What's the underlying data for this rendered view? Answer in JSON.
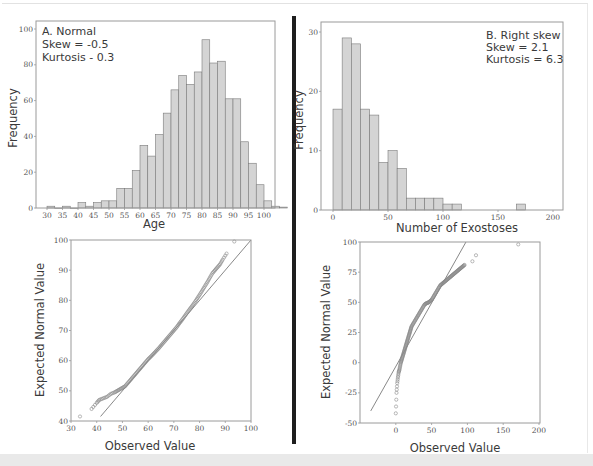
{
  "chart_data": [
    {
      "id": "hist-a",
      "type": "bar",
      "title": "A. Normal",
      "annotations": [
        "A. Normal",
        "Skew = -0.5",
        "Kurtosis - 0.3"
      ],
      "xlabel": "Age",
      "ylabel": "Frequency",
      "xlim": [
        26,
        104
      ],
      "ylim": [
        0,
        105
      ],
      "xticks": [
        30,
        35,
        40,
        45,
        50,
        55,
        60,
        65,
        70,
        75,
        80,
        85,
        90,
        95,
        100
      ],
      "yticks": [
        0,
        20,
        40,
        60,
        80,
        100
      ],
      "bin_width": 2.5,
      "bin_starts": [
        30,
        32.5,
        35,
        37.5,
        40,
        42.5,
        45,
        47.5,
        50,
        52.5,
        55,
        57.5,
        60,
        62.5,
        65,
        67.5,
        70,
        72.5,
        75,
        77.5,
        80,
        82.5,
        85,
        87.5,
        90,
        92.5,
        95,
        97.5
      ],
      "values": [
        0,
        1,
        1,
        0,
        3,
        1,
        3,
        4,
        4,
        11,
        11,
        21,
        35,
        29,
        41,
        53,
        66,
        74,
        69,
        76,
        94,
        81,
        82,
        61,
        61,
        37,
        25,
        13,
        4,
        1,
        0.5
      ],
      "bars": [
        {
          "x": 32.5,
          "v": 1
        },
        {
          "x": 35,
          "v": 0
        },
        {
          "x": 37.5,
          "v": 1
        },
        {
          "x": 40,
          "v": 0
        },
        {
          "x": 42.5,
          "v": 3
        },
        {
          "x": 45,
          "v": 1
        },
        {
          "x": 47.5,
          "v": 3
        },
        {
          "x": 50,
          "v": 4
        },
        {
          "x": 52.5,
          "v": 4
        },
        {
          "x": 55,
          "v": 11
        },
        {
          "x": 57.5,
          "v": 11
        },
        {
          "x": 60,
          "v": 21
        },
        {
          "x": 62.5,
          "v": 35
        },
        {
          "x": 65,
          "v": 29
        },
        {
          "x": 67.5,
          "v": 41
        },
        {
          "x": 70,
          "v": 53
        },
        {
          "x": 72.5,
          "v": 66
        },
        {
          "x": 75,
          "v": 74
        },
        {
          "x": 77.5,
          "v": 69
        },
        {
          "x": 80,
          "v": 76
        },
        {
          "x": 82.5,
          "v": 94
        },
        {
          "x": 85,
          "v": 81
        },
        {
          "x": 87.5,
          "v": 82
        },
        {
          "x": 90,
          "v": 61
        },
        {
          "x": 92.5,
          "v": 61
        },
        {
          "x": 95,
          "v": 37
        },
        {
          "x": 97.5,
          "v": 25
        },
        {
          "x": 100,
          "v": 13
        },
        {
          "x": 102.5,
          "v": 4
        },
        {
          "x": 105,
          "v": 1
        },
        {
          "x": 107.5,
          "v": 0.5
        }
      ],
      "grid": false
    },
    {
      "id": "hist-b",
      "type": "bar",
      "title": "B. Right skew",
      "annotations": [
        "B. Right skew",
        "Skew = 2.1",
        "Kurtosis = 6.3"
      ],
      "xlabel": "Number of Exostoses",
      "ylabel": "Frequency",
      "xlim": [
        -11,
        209
      ],
      "ylim": [
        0,
        31.5
      ],
      "xticks": [
        0,
        50,
        100,
        150,
        200
      ],
      "yticks": [
        0,
        10,
        20,
        30
      ],
      "bin_width": 8.33,
      "bars": [
        {
          "x": 0,
          "v": 17
        },
        {
          "x": 8.33,
          "v": 29
        },
        {
          "x": 16.67,
          "v": 28
        },
        {
          "x": 25,
          "v": 17
        },
        {
          "x": 33.33,
          "v": 16
        },
        {
          "x": 41.67,
          "v": 8
        },
        {
          "x": 50,
          "v": 10
        },
        {
          "x": 58.33,
          "v": 7
        },
        {
          "x": 66.67,
          "v": 2
        },
        {
          "x": 75,
          "v": 2
        },
        {
          "x": 83.33,
          "v": 2
        },
        {
          "x": 91.67,
          "v": 2
        },
        {
          "x": 100,
          "v": 1
        },
        {
          "x": 108.33,
          "v": 1
        },
        {
          "x": 166.67,
          "v": 1
        }
      ],
      "grid": false
    },
    {
      "id": "qq-a",
      "type": "scatter",
      "title": "Normal Q-Q plot (Age)",
      "xlabel": "Observed Value",
      "ylabel": "Expected Normal Value",
      "xlim": [
        30,
        100
      ],
      "ylim": [
        40,
        100
      ],
      "xticks": [
        30,
        40,
        50,
        60,
        70,
        80,
        90,
        100
      ],
      "yticks": [
        40,
        50,
        60,
        70,
        80,
        90,
        100
      ],
      "reference_line": [
        [
          41.5,
          41.5
        ],
        [
          100,
          100
        ]
      ],
      "points": [
        [
          33.5,
          41.5
        ],
        [
          38,
          44
        ],
        [
          40,
          46
        ],
        [
          41,
          47
        ],
        [
          42.5,
          47.5
        ],
        [
          44,
          48
        ],
        [
          45.5,
          49
        ],
        [
          47,
          49.5
        ],
        [
          48,
          50
        ],
        [
          49,
          50.5
        ],
        [
          50,
          51
        ],
        [
          51,
          51.5
        ],
        [
          52,
          52.5
        ],
        [
          53,
          53.5
        ],
        [
          54,
          54.5
        ],
        [
          55,
          55.5
        ],
        [
          56,
          56.5
        ],
        [
          57,
          57.5
        ],
        [
          58,
          58.5
        ],
        [
          59,
          59.5
        ],
        [
          60,
          60.5
        ],
        [
          61,
          61.3
        ],
        [
          62,
          62.2
        ],
        [
          63,
          63.1
        ],
        [
          64,
          64
        ],
        [
          65,
          65
        ],
        [
          66,
          66
        ],
        [
          67,
          67
        ],
        [
          68,
          68
        ],
        [
          69,
          69
        ],
        [
          70,
          70
        ],
        [
          71,
          71
        ],
        [
          72,
          72.2
        ],
        [
          73,
          73.3
        ],
        [
          74,
          74.5
        ],
        [
          75,
          75.7
        ],
        [
          76,
          76.9
        ],
        [
          77,
          78
        ],
        [
          78,
          79.2
        ],
        [
          79,
          80.5
        ],
        [
          80,
          81.8
        ],
        [
          81,
          83.2
        ],
        [
          82,
          84.6
        ],
        [
          83,
          86
        ],
        [
          84,
          87.5
        ],
        [
          85,
          89
        ],
        [
          86,
          90
        ],
        [
          87,
          91
        ],
        [
          88,
          92
        ],
        [
          89,
          93.5
        ],
        [
          90.5,
          95.5
        ],
        [
          93.5,
          99.5
        ]
      ],
      "grid": false
    },
    {
      "id": "qq-b",
      "type": "scatter",
      "title": "Normal Q-Q plot (Number of Exostoses)",
      "xlabel": "Observed Value",
      "ylabel": "Expected Normal Value",
      "xlim": [
        -50,
        200
      ],
      "ylim": [
        -50,
        100
      ],
      "xticks": [
        0,
        50,
        100,
        150,
        200
      ],
      "yticks": [
        -50,
        -25,
        0,
        25,
        50,
        75,
        100
      ],
      "reference_line": [
        [
          -35,
          -40
        ],
        [
          98,
          100
        ]
      ],
      "points": [
        [
          0,
          -42
        ],
        [
          1,
          -25
        ],
        [
          2,
          -17
        ],
        [
          3,
          -12
        ],
        [
          4,
          -8
        ],
        [
          5,
          -6
        ],
        [
          6,
          -3
        ],
        [
          7,
          0
        ],
        [
          8,
          2
        ],
        [
          9,
          4
        ],
        [
          10,
          6
        ],
        [
          11,
          8
        ],
        [
          12,
          10
        ],
        [
          13,
          12
        ],
        [
          14,
          14
        ],
        [
          15,
          16
        ],
        [
          16,
          18
        ],
        [
          17,
          20
        ],
        [
          18,
          22
        ],
        [
          19,
          24
        ],
        [
          20,
          26
        ],
        [
          21,
          28
        ],
        [
          22,
          30
        ],
        [
          24,
          32
        ],
        [
          26,
          34
        ],
        [
          28,
          36
        ],
        [
          30,
          38
        ],
        [
          32,
          40
        ],
        [
          34,
          42
        ],
        [
          36,
          44
        ],
        [
          38,
          46
        ],
        [
          40,
          48
        ],
        [
          42,
          49
        ],
        [
          44,
          49.5
        ],
        [
          46,
          50
        ],
        [
          48,
          51
        ],
        [
          50,
          52
        ],
        [
          52,
          54
        ],
        [
          54,
          56
        ],
        [
          56,
          58
        ],
        [
          58,
          60
        ],
        [
          60,
          62
        ],
        [
          62,
          64
        ],
        [
          64,
          65
        ],
        [
          66,
          66
        ],
        [
          68,
          67
        ],
        [
          70,
          68
        ],
        [
          72,
          69
        ],
        [
          74,
          70
        ],
        [
          76,
          71
        ],
        [
          78,
          72
        ],
        [
          80,
          73
        ],
        [
          82,
          74
        ],
        [
          84,
          75
        ],
        [
          86,
          76
        ],
        [
          88,
          77
        ],
        [
          90,
          78
        ],
        [
          92,
          79
        ],
        [
          94,
          80
        ],
        [
          96,
          81
        ],
        [
          107,
          84
        ],
        [
          112,
          89
        ],
        [
          171,
          98
        ]
      ],
      "grid": false
    }
  ],
  "panels": {
    "hist_a": {
      "annot_1": "A. Normal",
      "annot_2": "Skew = -0.5",
      "annot_3": "Kurtosis - 0.3",
      "xlabel": "Age",
      "ylabel": "Frequency"
    },
    "hist_b": {
      "annot_1": "B. Right skew",
      "annot_2": "Skew = 2.1",
      "annot_3": "Kurtosis = 6.3",
      "xlabel": "Number of Exostoses",
      "ylabel": "Frequency"
    },
    "qq_a": {
      "xlabel": "Observed Value",
      "ylabel": "Expected Normal Value"
    },
    "qq_b": {
      "xlabel": "Observed Value",
      "ylabel": "Expected Normal Value"
    }
  },
  "colors": {
    "bar_fill": "#d4d4d4",
    "bar_stroke": "#7a7a7a",
    "frame": "#9a9a9a",
    "points": "#8a8a8a",
    "ref_line": "#6a6a6a",
    "divider": "#1e1e1e"
  }
}
